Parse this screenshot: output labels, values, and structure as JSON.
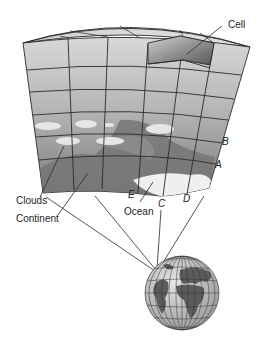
{
  "diagram": {
    "labels": {
      "cell": "Cell",
      "b": "B",
      "a": "A",
      "clouds": "Clouds",
      "continent": "Continent",
      "e": "E",
      "ocean": "Ocean",
      "c": "C",
      "d": "D"
    },
    "colors": {
      "grid_line": "#2a2a2a",
      "upper_face": "#d4d4d4",
      "lower_face": "#8a8a8a",
      "clouds": "#e4e4e4",
      "continent": "#7a7a7a",
      "ocean": "#efefef",
      "globe_ocean": "#c8c8c8",
      "globe_land": "#5c5c5c"
    }
  }
}
